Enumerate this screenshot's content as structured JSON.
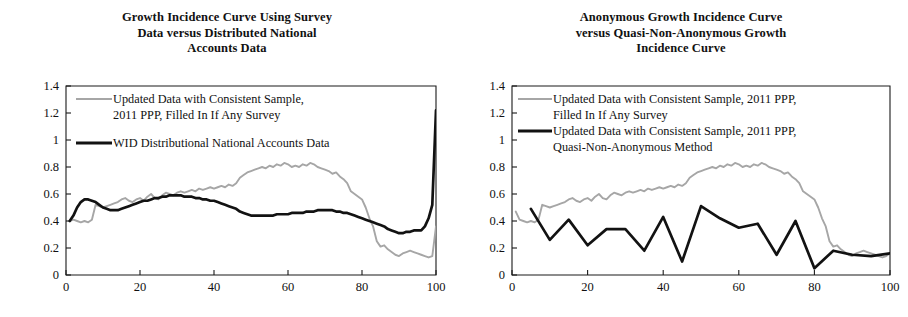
{
  "figure": {
    "panel_count": 2
  },
  "panels": [
    {
      "id": "left-panel",
      "title_lines": [
        "Growth Incidence Curve Using Survey",
        "Data versus Distributed National",
        "Accounts Data"
      ],
      "legend": [
        {
          "style": "gray",
          "lines": [
            "Updated Data with Consistent Sample,",
            "2011 PPP, Filled In If Any Survey"
          ]
        },
        {
          "style": "black",
          "lines": [
            "WID Distributional National Accounts Data"
          ]
        }
      ]
    },
    {
      "id": "right-panel",
      "title_lines": [
        "Anonymous Growth Incidence Curve",
        "versus Quasi-Non-Anonymous Growth",
        "Incidence Curve"
      ],
      "legend": [
        {
          "style": "gray",
          "lines": [
            "Updated Data with Consistent Sample, 2011 PPP,",
            "Filled In If Any Survey"
          ]
        },
        {
          "style": "black",
          "lines": [
            "Updated Data with Consistent Sample, 2011 PPP,",
            "Quasi-Non-Anonymous Method"
          ]
        }
      ]
    }
  ],
  "colors": {
    "gray_series": "#a6a6a6",
    "black_series": "#121212",
    "axis": "#1a1a1a",
    "text": "#111111",
    "background": "#ffffff"
  },
  "chart_data": [
    {
      "type": "line",
      "id": "growth-incidence-curve-survey-vs-dina",
      "title": "Growth Incidence Curve Using Survey Data versus Distributed National Accounts Data",
      "xlabel": "",
      "ylabel": "",
      "xlim": [
        0,
        100
      ],
      "ylim": [
        0,
        1.4
      ],
      "xticks": [
        0,
        20,
        40,
        60,
        80,
        100
      ],
      "yticks": [
        0,
        0.2,
        0.4,
        0.6,
        0.8,
        1,
        1.2,
        1.4
      ],
      "grid": false,
      "legend_position": "top-left-inside",
      "series": [
        {
          "name": "Updated Data with Consistent Sample, 2011 PPP, Filled In If Any Survey",
          "color": "#a6a6a6",
          "x": [
            1,
            2,
            3,
            4,
            5,
            6,
            7,
            8,
            9,
            10,
            11,
            12,
            13,
            14,
            15,
            16,
            17,
            18,
            19,
            20,
            21,
            22,
            23,
            24,
            25,
            26,
            27,
            28,
            29,
            30,
            31,
            32,
            33,
            34,
            35,
            36,
            37,
            38,
            39,
            40,
            41,
            42,
            43,
            44,
            45,
            46,
            47,
            48,
            49,
            50,
            51,
            52,
            53,
            54,
            55,
            56,
            57,
            58,
            59,
            60,
            61,
            62,
            63,
            64,
            65,
            66,
            67,
            68,
            69,
            70,
            71,
            72,
            73,
            74,
            75,
            76,
            77,
            78,
            79,
            80,
            81,
            82,
            83,
            84,
            85,
            86,
            87,
            88,
            89,
            90,
            91,
            92,
            93,
            94,
            95,
            96,
            97,
            98,
            99,
            100
          ],
          "y": [
            0.4,
            0.41,
            0.4,
            0.39,
            0.4,
            0.39,
            0.41,
            0.52,
            0.51,
            0.5,
            0.51,
            0.52,
            0.53,
            0.54,
            0.56,
            0.57,
            0.55,
            0.54,
            0.56,
            0.57,
            0.55,
            0.58,
            0.6,
            0.57,
            0.56,
            0.59,
            0.61,
            0.6,
            0.59,
            0.61,
            0.62,
            0.61,
            0.62,
            0.63,
            0.62,
            0.64,
            0.63,
            0.64,
            0.65,
            0.64,
            0.65,
            0.66,
            0.65,
            0.67,
            0.66,
            0.68,
            0.72,
            0.74,
            0.76,
            0.77,
            0.78,
            0.79,
            0.8,
            0.79,
            0.81,
            0.8,
            0.82,
            0.81,
            0.83,
            0.82,
            0.8,
            0.81,
            0.8,
            0.82,
            0.81,
            0.83,
            0.82,
            0.8,
            0.79,
            0.78,
            0.77,
            0.75,
            0.76,
            0.73,
            0.71,
            0.68,
            0.62,
            0.6,
            0.58,
            0.56,
            0.5,
            0.42,
            0.36,
            0.25,
            0.21,
            0.22,
            0.19,
            0.17,
            0.15,
            0.14,
            0.16,
            0.17,
            0.18,
            0.17,
            0.16,
            0.15,
            0.14,
            0.13,
            0.14,
            0.36
          ]
        },
        {
          "name": "WID Distributional National Accounts Data",
          "color": "#121212",
          "x": [
            1,
            2,
            3,
            4,
            5,
            6,
            7,
            8,
            9,
            10,
            11,
            12,
            13,
            14,
            15,
            16,
            17,
            18,
            19,
            20,
            21,
            22,
            23,
            24,
            25,
            26,
            27,
            28,
            29,
            30,
            31,
            32,
            33,
            34,
            35,
            36,
            37,
            38,
            39,
            40,
            41,
            42,
            43,
            44,
            45,
            46,
            47,
            48,
            49,
            50,
            51,
            52,
            53,
            54,
            55,
            56,
            57,
            58,
            59,
            60,
            61,
            62,
            63,
            64,
            65,
            66,
            67,
            68,
            69,
            70,
            71,
            72,
            73,
            74,
            75,
            76,
            77,
            78,
            79,
            80,
            81,
            82,
            83,
            84,
            85,
            86,
            87,
            88,
            89,
            90,
            91,
            92,
            93,
            94,
            95,
            96,
            97,
            98,
            99,
            100
          ],
          "y": [
            0.4,
            0.44,
            0.5,
            0.54,
            0.56,
            0.56,
            0.55,
            0.54,
            0.52,
            0.5,
            0.49,
            0.48,
            0.48,
            0.48,
            0.49,
            0.5,
            0.51,
            0.52,
            0.53,
            0.54,
            0.55,
            0.55,
            0.56,
            0.57,
            0.57,
            0.58,
            0.58,
            0.59,
            0.59,
            0.59,
            0.59,
            0.58,
            0.58,
            0.58,
            0.57,
            0.57,
            0.56,
            0.56,
            0.55,
            0.55,
            0.54,
            0.53,
            0.52,
            0.51,
            0.5,
            0.49,
            0.47,
            0.46,
            0.45,
            0.44,
            0.44,
            0.44,
            0.44,
            0.44,
            0.44,
            0.44,
            0.45,
            0.45,
            0.45,
            0.45,
            0.46,
            0.46,
            0.46,
            0.46,
            0.47,
            0.47,
            0.47,
            0.48,
            0.48,
            0.48,
            0.48,
            0.48,
            0.47,
            0.47,
            0.46,
            0.46,
            0.45,
            0.44,
            0.43,
            0.42,
            0.41,
            0.4,
            0.39,
            0.38,
            0.37,
            0.36,
            0.34,
            0.33,
            0.32,
            0.31,
            0.31,
            0.32,
            0.32,
            0.33,
            0.33,
            0.33,
            0.36,
            0.42,
            0.52,
            1.22
          ]
        }
      ]
    },
    {
      "type": "line",
      "id": "anonymous-vs-quasi-non-anonymous-gic",
      "title": "Anonymous Growth Incidence Curve versus Quasi-Non-Anonymous Growth Incidence Curve",
      "xlabel": "",
      "ylabel": "",
      "xlim": [
        0,
        100
      ],
      "ylim": [
        0,
        1.4
      ],
      "xticks": [
        0,
        20,
        40,
        60,
        80,
        100
      ],
      "yticks": [
        0,
        0.2,
        0.4,
        0.6,
        0.8,
        1,
        1.2,
        1.4
      ],
      "grid": false,
      "legend_position": "top-left-inside",
      "series": [
        {
          "name": "Updated Data with Consistent Sample, 2011 PPP, Filled In If Any Survey",
          "color": "#a6a6a6",
          "x": [
            1,
            2,
            3,
            4,
            5,
            6,
            7,
            8,
            9,
            10,
            11,
            12,
            13,
            14,
            15,
            16,
            17,
            18,
            19,
            20,
            21,
            22,
            23,
            24,
            25,
            26,
            27,
            28,
            29,
            30,
            31,
            32,
            33,
            34,
            35,
            36,
            37,
            38,
            39,
            40,
            41,
            42,
            43,
            44,
            45,
            46,
            47,
            48,
            49,
            50,
            51,
            52,
            53,
            54,
            55,
            56,
            57,
            58,
            59,
            60,
            61,
            62,
            63,
            64,
            65,
            66,
            67,
            68,
            69,
            70,
            71,
            72,
            73,
            74,
            75,
            76,
            77,
            78,
            79,
            80,
            81,
            82,
            83,
            84,
            85,
            86,
            87,
            88,
            89,
            90,
            91,
            92,
            93,
            94,
            95,
            96,
            97,
            98,
            99,
            100
          ],
          "y": [
            0.47,
            0.41,
            0.4,
            0.39,
            0.4,
            0.39,
            0.41,
            0.52,
            0.51,
            0.5,
            0.51,
            0.52,
            0.53,
            0.54,
            0.56,
            0.57,
            0.55,
            0.54,
            0.56,
            0.57,
            0.55,
            0.58,
            0.6,
            0.57,
            0.56,
            0.59,
            0.61,
            0.6,
            0.59,
            0.61,
            0.62,
            0.61,
            0.62,
            0.63,
            0.62,
            0.64,
            0.63,
            0.64,
            0.65,
            0.64,
            0.65,
            0.66,
            0.65,
            0.67,
            0.66,
            0.68,
            0.72,
            0.74,
            0.76,
            0.77,
            0.78,
            0.79,
            0.8,
            0.79,
            0.81,
            0.8,
            0.82,
            0.81,
            0.83,
            0.82,
            0.8,
            0.81,
            0.8,
            0.82,
            0.81,
            0.83,
            0.82,
            0.8,
            0.79,
            0.78,
            0.77,
            0.75,
            0.76,
            0.73,
            0.71,
            0.68,
            0.62,
            0.6,
            0.58,
            0.56,
            0.5,
            0.42,
            0.36,
            0.25,
            0.21,
            0.22,
            0.19,
            0.17,
            0.15,
            0.14,
            0.16,
            0.17,
            0.18,
            0.17,
            0.16,
            0.15,
            0.14,
            0.13,
            0.14,
            0.16
          ]
        },
        {
          "name": "Updated Data with Consistent Sample, 2011 PPP, Quasi-Non-Anonymous Method",
          "color": "#121212",
          "x": [
            5,
            10,
            15,
            20,
            25,
            30,
            35,
            40,
            45,
            50,
            55,
            60,
            65,
            70,
            75,
            80,
            85,
            90,
            95,
            100
          ],
          "y": [
            0.49,
            0.26,
            0.41,
            0.22,
            0.34,
            0.34,
            0.18,
            0.43,
            0.1,
            0.51,
            0.42,
            0.35,
            0.38,
            0.15,
            0.4,
            0.05,
            0.18,
            0.15,
            0.14,
            0.16
          ]
        }
      ]
    }
  ]
}
